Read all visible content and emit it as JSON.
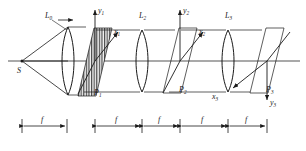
{
  "figure": {
    "type": "optical-system-diagram",
    "stroke_color": "#1a1a1a",
    "grating_fill": "#f2f2f2"
  },
  "source": {
    "label": "S",
    "name": "point-source"
  },
  "lenses": [
    {
      "label": "L",
      "sub": "0",
      "name": "lens-L0"
    },
    {
      "label": "L",
      "sub": "2",
      "name": "lens-L2"
    },
    {
      "label": "L",
      "sub": "3",
      "name": "lens-L3"
    }
  ],
  "planes": [
    {
      "label": "P",
      "sub": "1",
      "name": "plane-P1",
      "hatched": true
    },
    {
      "label": "P",
      "sub": "2",
      "name": "plane-P2",
      "hatched": false
    },
    {
      "label": "P",
      "sub": "3",
      "name": "plane-P3",
      "hatched": false
    }
  ],
  "axes": [
    {
      "y": "y",
      "ysub": "1",
      "x": "x",
      "xsub": "1",
      "x_direction": "up-right"
    },
    {
      "y": "y",
      "ysub": "2",
      "x": "x",
      "xsub": "2",
      "x_direction": "up-right"
    },
    {
      "y": "y",
      "ysub": "3",
      "x": "x",
      "xsub": "3",
      "x_direction": "down-left"
    }
  ],
  "dimensions": {
    "label": "f",
    "count": 5,
    "segments": [
      "f",
      "f",
      "f",
      "f",
      "f"
    ]
  }
}
